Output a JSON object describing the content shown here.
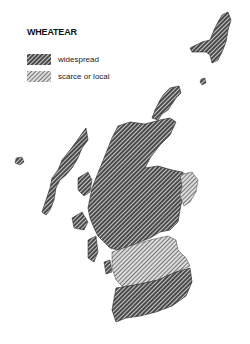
{
  "map": {
    "title": "WHEATEAR",
    "region": "Scotland",
    "legend": [
      {
        "key": "widespread",
        "label": "widespread",
        "pattern": "dense-crosshatch",
        "color": "#333333"
      },
      {
        "key": "scarce",
        "label": "scarce or local",
        "pattern": "light-diagonal",
        "color": "#888888"
      }
    ]
  }
}
